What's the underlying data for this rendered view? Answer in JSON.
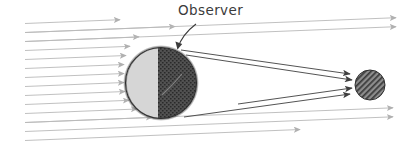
{
  "figure": {
    "kind": "astronomy-ray-diagram",
    "background_color": "#ffffff",
    "width": 415,
    "height": 147,
    "annotations": [
      {
        "id": "observer",
        "text": "Observer",
        "x": 178,
        "y": 4,
        "color": "#3b3b3b",
        "font_size": 13.5,
        "pointer_to": {
          "x": 178,
          "y": 49
        }
      }
    ]
  },
  "colors": {
    "incoming_ray": "#b9b9b9",
    "shadow_ray": "#4a4a4a",
    "sphere_outline": "#2e2e2e",
    "sphere_lit": "#d6d6d6",
    "sphere_dark": "#4d4d4d",
    "small_sphere": "#6a6a6a",
    "label_text": "#3b3b3b",
    "background": "#ffffff"
  },
  "bodies": [
    {
      "id": "large-sphere",
      "name": "large-body",
      "cx": 161,
      "cy": 83,
      "r": 35.5,
      "lit_side": "left",
      "lit_fill": "#d6d6d6",
      "dark_fill": "#4d4d4d",
      "terminator_x": 158,
      "outline_color": "#2e2e2e",
      "has_stipple_fringe": true
    },
    {
      "id": "small-sphere",
      "name": "small-body",
      "cx": 370,
      "cy": 85,
      "r": 15,
      "fill": "#6a6a6a",
      "pattern": "diagonal-hatch",
      "outline_color": "#2e2e2e"
    }
  ],
  "incoming_rays": {
    "count": 14,
    "color": "#b9b9b9",
    "start_x": 25,
    "first_y": 20,
    "spacing_y": 9,
    "slope_rise_per_px": -0.04,
    "arrowheads": true,
    "note": "parallel light rays arriving from the left and striking the lit limb"
  },
  "passing_rays": {
    "count": 4,
    "color": "#b9b9b9",
    "end_x": 396,
    "top_indices": [
      1,
      2
    ],
    "bottom_indices": [
      11,
      12
    ],
    "note": "rays that miss the large body and continue past it with arrowheads"
  },
  "shadow_cone_rays": [
    {
      "id": "cone-top-outer",
      "x1": 181,
      "y1": 50,
      "x2": 350,
      "y2": 74
    },
    {
      "id": "cone-top-inner",
      "x1": 185,
      "y1": 54,
      "x2": 352,
      "y2": 80
    },
    {
      "id": "cone-bottom-inner",
      "x1": 188,
      "y1": 111,
      "x2": 352,
      "y2": 88
    },
    {
      "id": "cone-bottom-outer",
      "x1": 183,
      "y1": 116,
      "x2": 350,
      "y2": 94
    }
  ]
}
